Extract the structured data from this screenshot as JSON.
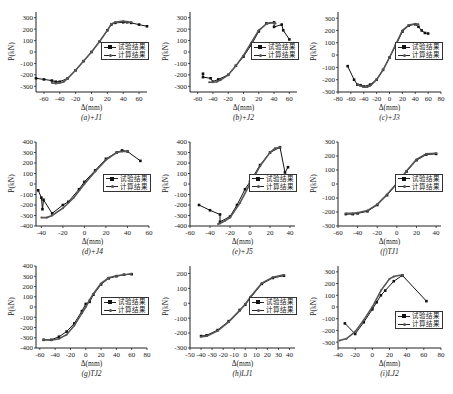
{
  "figure": {
    "legend": {
      "test": "试验结果",
      "calc": "计算结果"
    },
    "colors": {
      "test": "#111111",
      "calc": "#555555",
      "axis": "#222222"
    }
  },
  "chart_data": [
    {
      "id": "a",
      "type": "line",
      "caption": "(a)+J1",
      "xlabel": "Δ(mm)",
      "ylabel": "P(kN)",
      "xlim": [
        -70,
        70
      ],
      "ylim": [
        -350,
        350
      ],
      "xticks": [
        -60,
        -40,
        -20,
        0,
        20,
        40,
        60
      ],
      "yticks": [
        -300,
        -200,
        -100,
        0,
        100,
        200,
        300
      ],
      "legend_position": "right-middle",
      "series": [
        {
          "name": "试验结果",
          "x": [
            -70,
            -60,
            -50,
            -45,
            -40,
            -30,
            -20,
            -10,
            0,
            10,
            20,
            25,
            30,
            40,
            45,
            50,
            60,
            70
          ],
          "y": [
            -230,
            -240,
            -250,
            -260,
            -260,
            -230,
            -160,
            -80,
            0,
            90,
            190,
            240,
            255,
            260,
            260,
            255,
            240,
            225
          ]
        },
        {
          "name": "计算结果",
          "x": [
            -50,
            -45,
            -40,
            -35,
            -30,
            -20,
            -10,
            0,
            10,
            20,
            25,
            30,
            40,
            45,
            50
          ],
          "y": [
            -270,
            -275,
            -270,
            -260,
            -230,
            -160,
            -80,
            0,
            90,
            190,
            245,
            260,
            270,
            265,
            260
          ]
        }
      ]
    },
    {
      "id": "b",
      "type": "line",
      "caption": "(b)+J2",
      "xlabel": "Δ(mm)",
      "ylabel": "P(kN)",
      "xlim": [
        -70,
        70
      ],
      "ylim": [
        -350,
        350
      ],
      "xticks": [
        -60,
        -40,
        -20,
        0,
        20,
        40,
        60
      ],
      "yticks": [
        -300,
        -200,
        -100,
        0,
        100,
        200,
        300
      ],
      "legend_position": "right-middle",
      "series": [
        {
          "name": "试验结果",
          "x": [
            -53,
            -53,
            -43,
            -40,
            -33,
            -20,
            -10,
            0,
            10,
            20,
            30,
            40,
            40,
            50,
            52,
            60
          ],
          "y": [
            -190,
            -220,
            -230,
            -260,
            -240,
            -200,
            -120,
            -40,
            60,
            180,
            250,
            260,
            220,
            240,
            190,
            110
          ]
        },
        {
          "name": "计算结果",
          "x": [
            -45,
            -40,
            -35,
            -30,
            -20,
            -10,
            0,
            10,
            20,
            30,
            35,
            40,
            42
          ],
          "y": [
            -265,
            -265,
            -260,
            -245,
            -200,
            -120,
            -30,
            80,
            190,
            245,
            255,
            255,
            250
          ]
        }
      ]
    },
    {
      "id": "c",
      "type": "line",
      "caption": "(c)+J3",
      "xlabel": "Δ(mm)",
      "ylabel": "P(kN)",
      "xlim": [
        -80,
        80
      ],
      "ylim": [
        -300,
        350
      ],
      "xticks": [
        -80,
        -60,
        -40,
        -20,
        0,
        20,
        40,
        60,
        80
      ],
      "yticks": [
        -300,
        -200,
        -100,
        0,
        100,
        200,
        300
      ],
      "legend_position": "right-middle",
      "series": [
        {
          "name": "试验结果",
          "x": [
            -65,
            -55,
            -50,
            -45,
            -40,
            -30,
            -20,
            -10,
            0,
            10,
            20,
            30,
            40,
            45,
            50,
            55,
            60
          ],
          "y": [
            -90,
            -200,
            -240,
            -245,
            -255,
            -240,
            -200,
            -120,
            -20,
            80,
            190,
            240,
            250,
            230,
            200,
            180,
            175
          ]
        },
        {
          "name": "计算结果",
          "x": [
            -50,
            -40,
            -35,
            -30,
            -20,
            -10,
            0,
            10,
            20,
            30,
            40,
            45
          ],
          "y": [
            -240,
            -260,
            -260,
            -250,
            -200,
            -120,
            -20,
            90,
            200,
            245,
            255,
            250
          ]
        }
      ]
    },
    {
      "id": "d",
      "type": "line",
      "caption": "(d)+J4",
      "xlabel": "Δ(mm)",
      "ylabel": "P(kN)",
      "xlim": [
        -45,
        60
      ],
      "ylim": [
        -400,
        400
      ],
      "xticks": [
        -40,
        -20,
        0,
        20,
        40,
        60
      ],
      "yticks": [
        -400,
        -300,
        -200,
        -100,
        0,
        100,
        200,
        300,
        400
      ],
      "legend_position": "right-middle",
      "series": [
        {
          "name": "试验结果",
          "x": [
            -43,
            -40,
            -39,
            -38,
            -30,
            -20,
            -15,
            -5,
            0,
            10,
            20,
            30,
            35,
            40,
            52
          ],
          "y": [
            -60,
            -130,
            -240,
            -150,
            -280,
            -200,
            -170,
            -50,
            20,
            130,
            240,
            300,
            320,
            310,
            220
          ]
        },
        {
          "name": "计算结果",
          "x": [
            -40,
            -35,
            -30,
            -20,
            -10,
            0,
            10,
            20,
            30,
            35,
            40
          ],
          "y": [
            -320,
            -320,
            -300,
            -230,
            -130,
            0,
            120,
            230,
            300,
            310,
            310
          ]
        }
      ]
    },
    {
      "id": "e",
      "type": "line",
      "caption": "(e)+J5",
      "xlabel": "Δ(mm)",
      "ylabel": "P(kN)",
      "xlim": [
        -60,
        45
      ],
      "ylim": [
        -400,
        400
      ],
      "xticks": [
        -60,
        -40,
        -20,
        0,
        20,
        40
      ],
      "yticks": [
        -400,
        -300,
        -200,
        -100,
        0,
        100,
        200,
        300,
        400
      ],
      "legend_position": "right-middle",
      "series": [
        {
          "name": "试验结果",
          "x": [
            -51,
            -40,
            -30,
            -30,
            -20,
            -13,
            -5,
            0,
            10,
            20,
            30,
            35,
            38
          ],
          "y": [
            -200,
            -250,
            -290,
            -360,
            -310,
            -200,
            -50,
            20,
            180,
            300,
            350,
            110,
            160
          ]
        },
        {
          "name": "计算结果",
          "x": [
            -32,
            -30,
            -25,
            -20,
            -10,
            0,
            10,
            20,
            25,
            30
          ],
          "y": [
            -380,
            -375,
            -350,
            -320,
            -180,
            0,
            170,
            300,
            340,
            350
          ]
        }
      ]
    },
    {
      "id": "f",
      "type": "line",
      "caption": "(f)TJ1",
      "xlabel": "Δ(mm)",
      "ylabel": "P(kN)",
      "xlim": [
        -60,
        45
      ],
      "ylim": [
        -300,
        300
      ],
      "xticks": [
        -60,
        -40,
        -20,
        0,
        20,
        40
      ],
      "yticks": [
        -300,
        -200,
        -100,
        0,
        100,
        200,
        300
      ],
      "legend_position": "right-middle",
      "series": [
        {
          "name": "试验结果",
          "x": [
            -52,
            -45,
            -40,
            -30,
            -20,
            -10,
            0,
            10,
            20,
            30,
            40
          ],
          "y": [
            -215,
            -215,
            -210,
            -195,
            -150,
            -80,
            0,
            90,
            170,
            210,
            215
          ]
        },
        {
          "name": "计算结果",
          "x": [
            -52,
            -45,
            -40,
            -30,
            -20,
            -10,
            0,
            10,
            20,
            30,
            40
          ],
          "y": [
            -210,
            -210,
            -205,
            -190,
            -145,
            -75,
            5,
            95,
            175,
            215,
            220
          ]
        }
      ]
    },
    {
      "id": "g",
      "type": "line",
      "caption": "(g)TJ2",
      "xlabel": "Δ(mm)",
      "ylabel": "P(kN)",
      "xlim": [
        -65,
        80
      ],
      "ylim": [
        -400,
        400
      ],
      "xticks": [
        -60,
        -40,
        -20,
        0,
        20,
        40,
        60,
        80
      ],
      "yticks": [
        -400,
        -300,
        -200,
        -100,
        0,
        100,
        200,
        300,
        400
      ],
      "legend_position": "right-middle",
      "series": [
        {
          "name": "试验结果",
          "x": [
            -55,
            -45,
            -35,
            -25,
            -15,
            -5,
            0,
            5,
            10,
            20,
            30,
            40,
            50,
            60
          ],
          "y": [
            -320,
            -320,
            -290,
            -240,
            -160,
            -40,
            30,
            50,
            120,
            220,
            280,
            300,
            315,
            320
          ]
        },
        {
          "name": "计算结果",
          "x": [
            -55,
            -45,
            -35,
            -25,
            -15,
            -5,
            0,
            5,
            10,
            20,
            30,
            40,
            50,
            60
          ],
          "y": [
            -320,
            -325,
            -310,
            -270,
            -180,
            -60,
            0,
            70,
            130,
            230,
            285,
            305,
            315,
            325
          ]
        }
      ]
    },
    {
      "id": "h",
      "type": "line",
      "caption": "(h)LJ1",
      "xlabel": "Δ(mm)",
      "ylabel": "P(kN)",
      "xlim": [
        -50,
        45
      ],
      "ylim": [
        -300,
        250
      ],
      "xticks": [
        -50,
        -40,
        -30,
        -20,
        -10,
        0,
        10,
        20,
        30,
        40
      ],
      "yticks": [
        -300,
        -200,
        -100,
        0,
        100,
        200
      ],
      "legend_position": "right-middle",
      "series": [
        {
          "name": "试验结果",
          "x": [
            -40,
            -35,
            -25,
            -15,
            -5,
            0,
            5,
            15,
            25,
            35
          ],
          "y": [
            -220,
            -215,
            -180,
            -120,
            -45,
            -10,
            40,
            130,
            170,
            185
          ]
        },
        {
          "name": "计算结果",
          "x": [
            -40,
            -35,
            -25,
            -15,
            -5,
            0,
            5,
            15,
            25,
            35
          ],
          "y": [
            -225,
            -220,
            -185,
            -125,
            -50,
            -5,
            45,
            135,
            175,
            190
          ]
        }
      ]
    },
    {
      "id": "i",
      "type": "line",
      "caption": "(i)LJ2",
      "xlabel": "Δ(mm)",
      "ylabel": "P(kN)",
      "xlim": [
        -40,
        80
      ],
      "ylim": [
        -350,
        350
      ],
      "xticks": [
        -40,
        -20,
        0,
        20,
        40,
        60,
        80
      ],
      "yticks": [
        -300,
        -200,
        -100,
        0,
        100,
        200,
        300
      ],
      "legend_position": "right-lower",
      "series": [
        {
          "name": "试验结果",
          "x": [
            -32,
            -20,
            -10,
            0,
            5,
            10,
            15,
            25,
            35,
            63
          ],
          "y": [
            -140,
            -230,
            -130,
            -20,
            40,
            100,
            140,
            220,
            270,
            50
          ]
        },
        {
          "name": "计算结果",
          "x": [
            -38,
            -30,
            -20,
            -10,
            0,
            10,
            20,
            25,
            35
          ],
          "y": [
            -285,
            -270,
            -210,
            -110,
            0,
            140,
            240,
            260,
            275
          ]
        }
      ]
    }
  ]
}
